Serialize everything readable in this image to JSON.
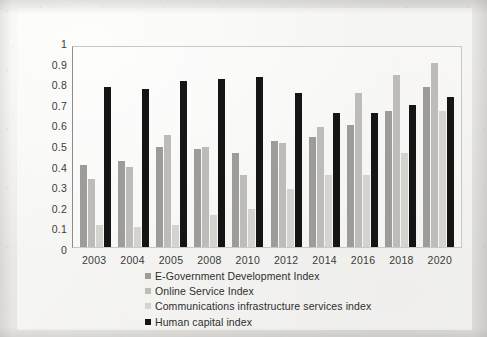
{
  "chart_data": {
    "type": "bar",
    "title": "",
    "subtitle": "",
    "xlabel": "",
    "ylabel": "",
    "ylim": [
      0,
      1
    ],
    "ytick_labels": [
      "1",
      "0.9",
      "0.8",
      "0.7",
      "0.6",
      "0.5",
      "0.4",
      "0.3",
      "0.2",
      "0.1",
      "0"
    ],
    "grid": false,
    "legend_position": "bottom",
    "categories": [
      "2003",
      "2004",
      "2005",
      "2008",
      "2010",
      "2012",
      "2014",
      "2016",
      "2018",
      "2020"
    ],
    "series": [
      {
        "name": "E-Government Development Index",
        "color": "#9d9c99",
        "values": [
          0.41,
          0.43,
          0.5,
          0.49,
          0.47,
          0.53,
          0.55,
          0.61,
          0.68,
          0.8
        ]
      },
      {
        "name": "Online Service Index",
        "color": "#bdbcb9",
        "values": [
          0.34,
          0.4,
          0.56,
          0.5,
          0.36,
          0.52,
          0.6,
          0.77,
          0.86,
          0.92
        ]
      },
      {
        "name": "Communications infrastructure services index",
        "color": "#d4d3d0",
        "values": [
          0.11,
          0.1,
          0.11,
          0.16,
          0.19,
          0.29,
          0.36,
          0.36,
          0.47,
          0.68
        ]
      },
      {
        "name": "Human capital index",
        "color": "#151515",
        "values": [
          0.8,
          0.79,
          0.83,
          0.84,
          0.85,
          0.77,
          0.67,
          0.67,
          0.71,
          0.75
        ]
      }
    ]
  },
  "legend": {
    "items": [
      {
        "label": "E-Government Development Index",
        "color": "#9d9c99"
      },
      {
        "label": "Online Service Index",
        "color": "#bdbcb9"
      },
      {
        "label": "Communications infrastructure services index",
        "color": "#d4d3d0"
      },
      {
        "label": "Human capital index",
        "color": "#151515"
      }
    ]
  }
}
